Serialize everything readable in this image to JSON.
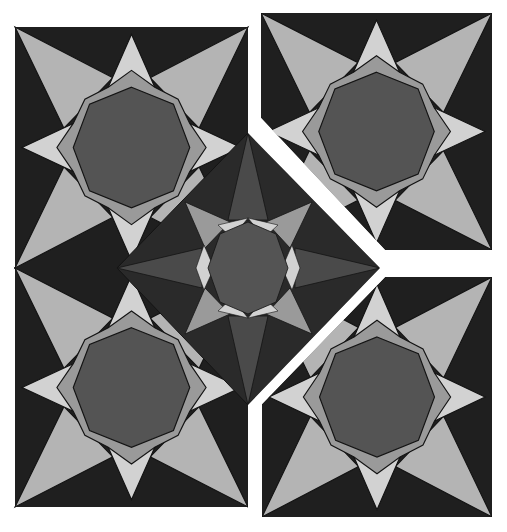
{
  "colors": {
    "background": "#ffffff",
    "dark": "#1f1f1f",
    "star_light": "#b4b4b4",
    "star_lighter": "#d2d2d2",
    "ring": "#9a9a9a",
    "octagon": "#545454",
    "diamond_face": "#4a4a4a",
    "diamond_dark": "#2a2a2a",
    "stroke": "#141414"
  },
  "tiles": [
    {
      "name": "top-left",
      "x": 15,
      "y": 27,
      "w": 233,
      "h": 241
    },
    {
      "name": "bottom-left",
      "x": 15,
      "y": 268,
      "w": 233,
      "h": 239
    },
    {
      "name": "top-right",
      "x": 261,
      "y": 13,
      "w": 231,
      "h": 237
    },
    {
      "name": "bottom-right",
      "x": 262,
      "y": 277,
      "w": 230,
      "h": 240
    }
  ],
  "center_star": {
    "cx": 248,
    "cy": 268,
    "rx": 131,
    "ry": 135
  }
}
